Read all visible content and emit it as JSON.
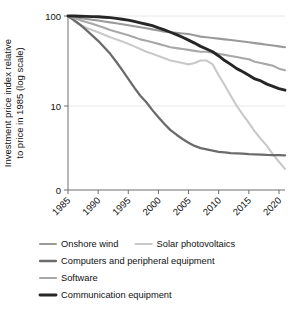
{
  "chart_data": {
    "type": "line",
    "title": "",
    "xlabel": "",
    "ylabel": "Investment price index relative to price in 1985 (log scale)",
    "x": [
      1985,
      1986,
      1987,
      1988,
      1989,
      1990,
      1991,
      1992,
      1993,
      1994,
      1995,
      1996,
      1997,
      1998,
      1999,
      2000,
      2001,
      2002,
      2003,
      2004,
      2005,
      2006,
      2007,
      2008,
      2009,
      2010,
      2011,
      2012,
      2013,
      2014,
      2015,
      2016,
      2017,
      2018,
      2019,
      2020,
      2021
    ],
    "xtick_labels": [
      "1985",
      "1990",
      "1995",
      "2000",
      "2005",
      "2010",
      "2015",
      "2020"
    ],
    "xticks": [
      1985,
      1990,
      1995,
      2000,
      2005,
      2010,
      2015,
      2020
    ],
    "ytick_labels": [
      "100",
      "10",
      "0"
    ],
    "yticks": [
      100,
      10
    ],
    "ylim": [
      2.0,
      100
    ],
    "yscale": "log",
    "grid": true,
    "legend_position": "bottom",
    "series": [
      {
        "name": "Onshore wind",
        "color": "#9a9a9a",
        "width": 2.1,
        "values": [
          100,
          97,
          95,
          93,
          91,
          89,
          87,
          85,
          83,
          81,
          79,
          77,
          75,
          73,
          71,
          69,
          67,
          66,
          65,
          64,
          63,
          61,
          59,
          58,
          57,
          56,
          55,
          54,
          53,
          52,
          51,
          50,
          49,
          48,
          47,
          46,
          45
        ]
      },
      {
        "name": "Solar photovoltaics",
        "color": "#c9c9c9",
        "width": 2.1,
        "values": [
          100,
          88,
          80,
          74,
          70,
          66,
          62,
          58,
          55,
          52,
          49,
          46,
          43,
          40,
          38,
          36,
          34,
          32,
          31,
          30,
          29,
          30,
          32,
          32,
          29,
          22,
          17,
          13,
          10,
          8.0,
          6.5,
          5.2,
          4.3,
          3.6,
          2.9,
          2.4,
          2.0
        ]
      },
      {
        "name": "Computers and peripheral equipment",
        "color": "#6b6b6b",
        "width": 2.3,
        "values": [
          100,
          90,
          80,
          70,
          61,
          53,
          45,
          38,
          31,
          25,
          20,
          16,
          13,
          11,
          9.0,
          7.5,
          6.3,
          5.4,
          4.8,
          4.3,
          3.9,
          3.6,
          3.4,
          3.3,
          3.2,
          3.1,
          3.05,
          3.0,
          2.98,
          2.95,
          2.92,
          2.9,
          2.88,
          2.86,
          2.85,
          2.84,
          2.83
        ]
      },
      {
        "name": "Software",
        "color": "#a8a8a8",
        "width": 2.1,
        "values": [
          100,
          95,
          90,
          86,
          82,
          78,
          74,
          70,
          67,
          64,
          61,
          58,
          55,
          53,
          51,
          49,
          47,
          45,
          44,
          43,
          42,
          41,
          40,
          40,
          39,
          38,
          37,
          36,
          35,
          34,
          33,
          31,
          30,
          29,
          28,
          26,
          25
        ]
      },
      {
        "name": "Communication equipment",
        "color": "#262626",
        "width": 2.9,
        "values": [
          100,
          100,
          99.5,
          99,
          98.5,
          98,
          97,
          96,
          94,
          92,
          90,
          87,
          84,
          81,
          78,
          74,
          70,
          66,
          62,
          58,
          54,
          50,
          46,
          43,
          40,
          36,
          32,
          29,
          26,
          24,
          22,
          20,
          19,
          17.5,
          16.5,
          15.6,
          15
        ]
      }
    ]
  },
  "legend": {
    "rows": [
      [
        {
          "label": "Onshore wind",
          "color": "#9a9a9a",
          "width": 2.1
        },
        {
          "label": "Solar photovoltaics",
          "color": "#c9c9c9",
          "width": 2.1
        }
      ],
      [
        {
          "label": "Computers and peripheral equipment",
          "color": "#6b6b6b",
          "width": 2.3
        }
      ],
      [
        {
          "label": "Software",
          "color": "#a8a8a8",
          "width": 2.1
        }
      ],
      [
        {
          "label": "Communication equipment",
          "color": "#262626",
          "width": 2.9
        }
      ]
    ]
  }
}
